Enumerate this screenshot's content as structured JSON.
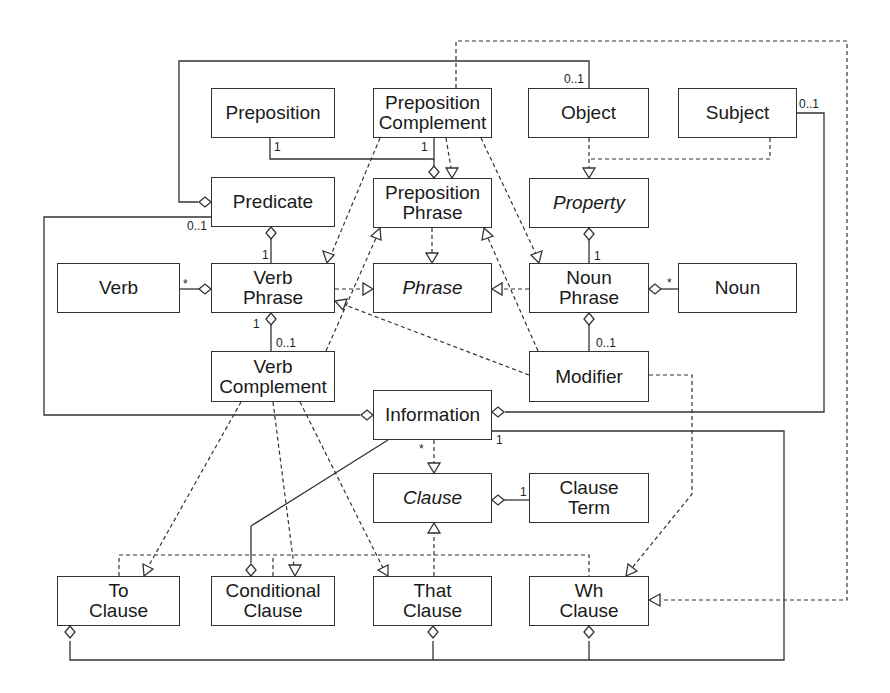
{
  "diagram": {
    "type": "UML class diagram",
    "classes": {
      "preposition": {
        "line1": "Preposition",
        "line2": ""
      },
      "preposition_complement": {
        "line1": "Preposition",
        "line2": "Complement"
      },
      "object": {
        "line1": "Object",
        "line2": ""
      },
      "subject": {
        "line1": "Subject",
        "line2": ""
      },
      "predicate": {
        "line1": "Predicate",
        "line2": ""
      },
      "preposition_phrase": {
        "line1": "Preposition",
        "line2": "Phrase"
      },
      "property": {
        "line1": "Property",
        "line2": "",
        "abstract": true
      },
      "verb": {
        "line1": "Verb",
        "line2": ""
      },
      "verb_phrase": {
        "line1": "Verb",
        "line2": "Phrase"
      },
      "phrase": {
        "line1": "Phrase",
        "line2": "",
        "abstract": true
      },
      "noun_phrase": {
        "line1": "Noun",
        "line2": "Phrase"
      },
      "noun": {
        "line1": "Noun",
        "line2": ""
      },
      "verb_complement": {
        "line1": "Verb",
        "line2": "Complement"
      },
      "modifier": {
        "line1": "Modifier",
        "line2": ""
      },
      "information": {
        "line1": "Information",
        "line2": ""
      },
      "clause": {
        "line1": "Clause",
        "line2": "",
        "abstract": true
      },
      "clause_term": {
        "line1": "Clause",
        "line2": "Term"
      },
      "to_clause": {
        "line1": "To",
        "line2": "Clause"
      },
      "conditional_clause": {
        "line1": "Conditional",
        "line2": "Clause"
      },
      "that_clause": {
        "line1": "That",
        "line2": "Clause"
      },
      "wh_clause": {
        "line1": "Wh",
        "line2": "Clause"
      }
    },
    "multiplicities": {
      "object_top": "0..1",
      "subject_right": "0..1",
      "preposition_bottom": "1",
      "prep_complement_bottom": "1",
      "predicate_left": "0..1",
      "verb_phrase_top": "1",
      "verb_star": "*",
      "verb_phrase_bottom": "1",
      "verb_complement_top": "0..1",
      "noun_phrase_top": "1",
      "noun_star": "*",
      "modifier_top": "0..1",
      "information_star": "*",
      "information_one": "1",
      "clause_term_one": "1"
    },
    "colors": {
      "line": "#333333",
      "background": "#ffffff"
    }
  }
}
